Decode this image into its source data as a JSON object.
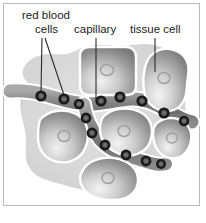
{
  "figure": {
    "frame": {
      "border_color": "#b9b9b9",
      "background": "#ffffff"
    }
  },
  "labels": {
    "red_blood_cells": {
      "line1": "red blood",
      "line2": "cells"
    },
    "capillary": {
      "text": "capillary"
    },
    "tissue_cell": {
      "text": "tissue cell"
    }
  },
  "colors": {
    "tissue_matrix": "#d8d8d8",
    "tissue_matrix_edge": "#c4c4c4",
    "cell_fill_light": "#eeeeee",
    "cell_fill_dark": "#808080",
    "cell_outline": "#ffffff",
    "nucleus_stroke": "#9a9a9a",
    "capillary_wall": "#9a9a9a",
    "capillary_fill": "#7e7e7e",
    "red_blood_cell": "#262626",
    "red_blood_cell_center": "#6d6d6d",
    "leader_line": "#2a2a2a",
    "text": "#1b1b1b"
  },
  "structures": {
    "tissue_cells": [
      {
        "id": "cell-top-center",
        "nucleus": true
      },
      {
        "id": "cell-top-right",
        "nucleus": true
      },
      {
        "id": "cell-mid-left",
        "nucleus": true
      },
      {
        "id": "cell-mid-center",
        "nucleus": true
      },
      {
        "id": "cell-mid-right",
        "nucleus": true
      },
      {
        "id": "cell-bottom-center",
        "nucleus": true
      }
    ],
    "red_blood_cell_count": 14,
    "capillary_branches": 2
  }
}
